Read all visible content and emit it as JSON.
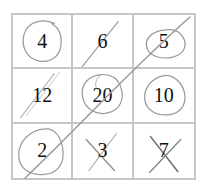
{
  "page": {
    "top_cut_text": "",
    "background_color": "#ffffff",
    "grid_line_color": "#c7c7c7",
    "ink_color": "#9a9a9a",
    "digit_color": "#111111"
  },
  "worksheet": {
    "rows": 3,
    "columns": 3,
    "cells": [
      {
        "value": "4",
        "mark": "circle",
        "row": 1,
        "col": 1
      },
      {
        "value": "6",
        "mark": "slash",
        "row": 1,
        "col": 2
      },
      {
        "value": "5",
        "mark": "circle-slash",
        "row": 1,
        "col": 3
      },
      {
        "value": "12",
        "mark": "slash",
        "row": 2,
        "col": 1
      },
      {
        "value": "20",
        "mark": "circle-slash",
        "row": 2,
        "col": 2
      },
      {
        "value": "10",
        "mark": "circle",
        "row": 2,
        "col": 3
      },
      {
        "value": "2",
        "mark": "circle-slash",
        "row": 3,
        "col": 1
      },
      {
        "value": "3",
        "mark": "cross",
        "row": 3,
        "col": 2
      },
      {
        "value": "7",
        "mark": "cross",
        "row": 3,
        "col": 3
      }
    ],
    "diagonal_line": {
      "present": true,
      "description": "long diagonal stroke from bottom-left cell to top-right cell",
      "from": [
        25,
        178
      ],
      "to": [
        190,
        17
      ]
    }
  }
}
